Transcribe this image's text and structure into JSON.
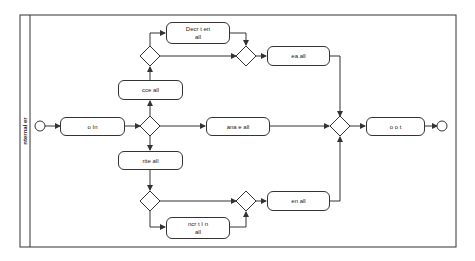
{
  "pool": {
    "lane_label": "nternal  er"
  },
  "nodes": {
    "login": "o  In",
    "access_mail": "cce        all",
    "decorate_mail": "Decr   t    eri\nall",
    "save_mail": "ea        all",
    "manage_mail": "ana  e        all",
    "write_mail": "rite       all",
    "encrypt_mail": "ncr   t    I  n\nall",
    "send_mail": "en          all",
    "logout": "o   o  t"
  },
  "colors": {
    "stroke": "#333333",
    "background": "#ffffff",
    "text": "#222222"
  }
}
